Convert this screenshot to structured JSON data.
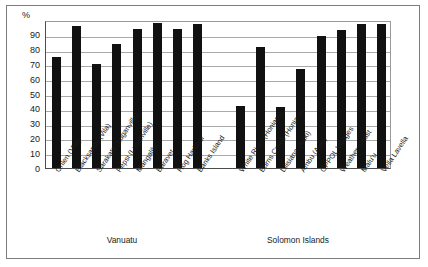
{
  "chart_data": {
    "type": "bar",
    "title": "",
    "xlabel": "",
    "ylabel": "%",
    "ylim": [
      0,
      100
    ],
    "ytick_labels": [
      "100",
      "90",
      "80",
      "70",
      "60",
      "50",
      "40",
      "30",
      "20",
      "10",
      "0"
    ],
    "ytick_values": [
      100,
      90,
      80,
      70,
      60,
      50,
      40,
      30,
      20,
      10,
      0
    ],
    "yaxis_unit_label": "%",
    "grid": true,
    "legend": "none",
    "bar_color": "#111111",
    "categories": [
      "Ohlen (Vila)",
      "Blacksands (Vila)",
      "Sarakata (Luganville)",
      "Pepsi (Luganville)",
      "Mangalilu",
      "Baravet",
      "Hog Harbour",
      "Banks Island",
      "White River (Honiara)",
      "Burns Creek (Honiara)",
      "Lilisiana (Auki)",
      "Ambu (Auki)",
      "GPPOL Villages",
      "Weather Coast",
      "Malu'u",
      "Vella Lavella"
    ],
    "values": [
      75,
      96,
      70,
      84,
      94,
      98,
      94,
      97,
      42,
      82,
      41,
      67,
      89,
      93,
      97,
      97
    ],
    "groups": [
      {
        "label": "Vanuatu",
        "start_index": 0,
        "count": 8
      },
      {
        "label": "Solomon Islands",
        "start_index": 8,
        "count": 8
      }
    ]
  }
}
